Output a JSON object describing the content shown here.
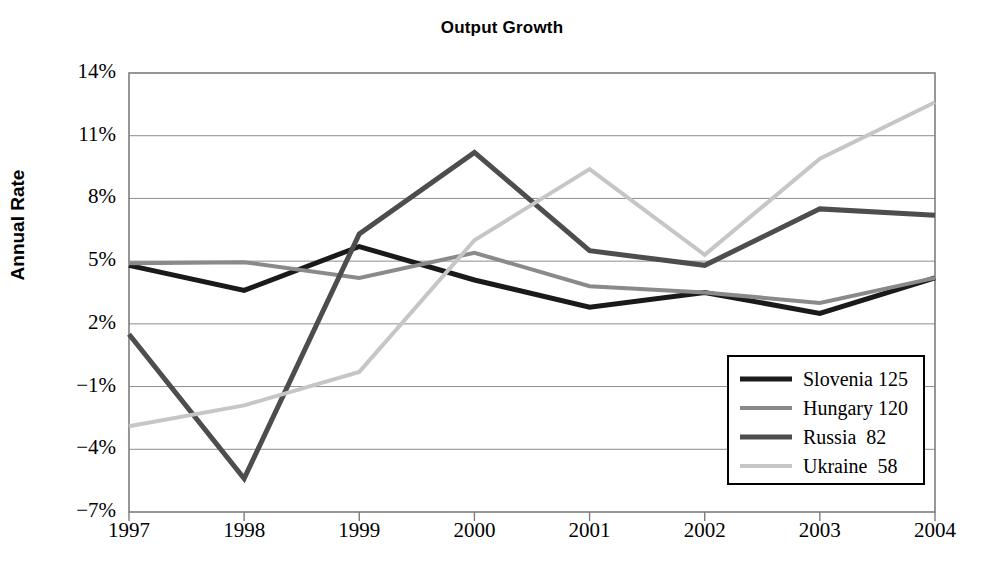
{
  "chart_data": {
    "type": "line",
    "title": "Output Growth",
    "xlabel": "",
    "ylabel": "Annual Rate",
    "x": [
      1997,
      1998,
      1999,
      2000,
      2001,
      2002,
      2003,
      2004
    ],
    "xtick_labels": [
      "1997",
      "1998",
      "1999",
      "2000",
      "2001",
      "2002",
      "2003",
      "2004"
    ],
    "ytick_labels": [
      "14%",
      "11%",
      "8%",
      "5%",
      "2%",
      "−1%",
      "−4%",
      "−7%"
    ],
    "ytick_values": [
      14,
      11,
      8,
      5,
      2,
      -1,
      -4,
      -7
    ],
    "ylim": [
      -7,
      14
    ],
    "xlim": [
      1997,
      2004
    ],
    "grid": true,
    "legend_position": "lower right",
    "series": [
      {
        "name": "Slovenia 125",
        "legend_label": "Slovenia 125",
        "color": "#1a1a1a",
        "width": 5,
        "values": [
          4.8,
          3.6,
          5.7,
          4.1,
          2.8,
          3.5,
          2.5,
          4.2
        ]
      },
      {
        "name": "Hungary 120",
        "legend_label": "Hungary 120",
        "color": "#8a8a8a",
        "width": 4,
        "values": [
          4.9,
          4.95,
          4.2,
          5.4,
          3.8,
          3.5,
          3.0,
          4.2
        ]
      },
      {
        "name": "Russia  82",
        "legend_label": "Russia  82",
        "color": "#4d4d4d",
        "width": 5,
        "values": [
          1.5,
          -5.4,
          6.3,
          10.2,
          5.5,
          4.8,
          7.5,
          7.2
        ]
      },
      {
        "name": "Ukraine  58",
        "legend_label": "Ukraine  58",
        "color": "#c6c6c6",
        "width": 4,
        "values": [
          -2.9,
          -1.9,
          -0.3,
          6.0,
          9.4,
          5.3,
          9.9,
          12.6
        ]
      }
    ]
  },
  "axes": {
    "plot_left": 129,
    "plot_right": 935,
    "plot_top": 73,
    "plot_bottom": 512,
    "axis_color": "#7d7d7d",
    "grid_color": "#8c8c8c"
  }
}
